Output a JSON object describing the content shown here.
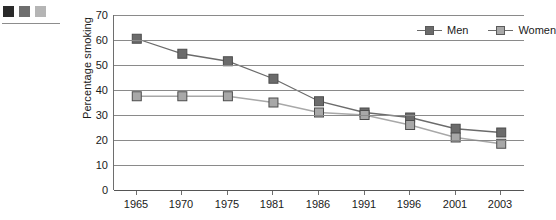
{
  "caption": {
    "swatches": [
      "#2a2a2a",
      "#6e6e6e",
      "#b5b5b5"
    ],
    "title_text": "y sex,\n003",
    "source_text": "ysicians\ni\nca) and\nMonitoring\n.",
    "swatch_names": [
      "swatch-dark",
      "swatch-medium",
      "swatch-light"
    ]
  },
  "chart_data": {
    "type": "line",
    "title": "",
    "xlabel": "",
    "ylabel": "Percentage smoking",
    "categories": [
      "1965",
      "1970",
      "1975",
      "1981",
      "1986",
      "1991",
      "1996",
      "2001",
      "2003"
    ],
    "series": [
      {
        "name": "Men",
        "color": "#6b6b6b",
        "marker": "square",
        "values": [
          60.5,
          54.5,
          51.5,
          44.5,
          35.5,
          31.0,
          29.0,
          24.5,
          23.0
        ]
      },
      {
        "name": "Women",
        "color": "#a8a8a8",
        "marker": "square",
        "values": [
          37.5,
          37.5,
          37.5,
          35.0,
          31.0,
          30.0,
          26.0,
          21.0,
          18.5
        ]
      }
    ],
    "ylim": [
      0,
      70
    ],
    "yticks": [
      0,
      10,
      20,
      30,
      40,
      50,
      60,
      70
    ],
    "ytick_labels": [
      "0",
      "10",
      "20",
      "30",
      "40",
      "50",
      "60",
      "70"
    ],
    "grid": true,
    "grid_color": "#8a8a8a",
    "legend_position": "top-right",
    "legend_entries": [
      "Men",
      "Women"
    ]
  }
}
